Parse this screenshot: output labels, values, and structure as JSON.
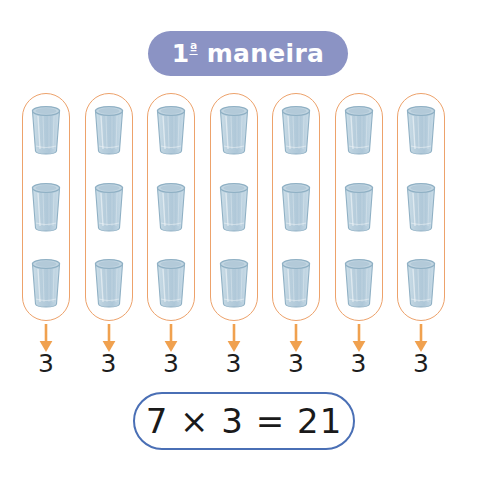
{
  "page": {
    "background_color": "#ffffff",
    "width": 485,
    "height": 491
  },
  "title_badge": {
    "ordinal_number": "1",
    "ordinal_suffix": "ª",
    "label": "maneira",
    "full_text": "1ª maneira",
    "background_color": "#8b93c4",
    "text_color": "#ffffff"
  },
  "groups": {
    "count": 7,
    "outline_color": "#eda26b",
    "arrow_color": "#f0a14f",
    "glass_fill_color": "#b9cfdd",
    "glass_stroke_color": "#8fb0c4",
    "items": [
      {
        "glasses": 3,
        "count_label": "3",
        "icon": "drinking-glass-icon"
      },
      {
        "glasses": 3,
        "count_label": "3",
        "icon": "drinking-glass-icon"
      },
      {
        "glasses": 3,
        "count_label": "3",
        "icon": "drinking-glass-icon"
      },
      {
        "glasses": 3,
        "count_label": "3",
        "icon": "drinking-glass-icon"
      },
      {
        "glasses": 3,
        "count_label": "3",
        "icon": "drinking-glass-icon"
      },
      {
        "glasses": 3,
        "count_label": "3",
        "icon": "drinking-glass-icon"
      },
      {
        "glasses": 3,
        "count_label": "3",
        "icon": "drinking-glass-icon"
      }
    ]
  },
  "equation": {
    "text": "7 × 3 = 21",
    "left_factor": "7",
    "operator": "×",
    "right_factor": "3",
    "equals": "=",
    "product": "21",
    "border_color": "#4a6fb5",
    "text_color": "#1a1a1a"
  }
}
